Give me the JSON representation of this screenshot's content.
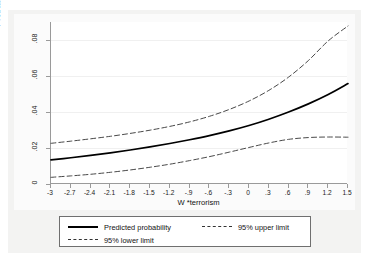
{
  "chart_data": {
    "type": "line",
    "title": "",
    "xlabel": "W  *terrorism",
    "ylabel": "Probability of the rule of law",
    "xlim": [
      -3,
      1.5
    ],
    "ylim": [
      0,
      0.09
    ],
    "grid": true,
    "legend_position": "bottom",
    "xticks": [
      "-3",
      "-2.7",
      "-2.4",
      "-2.1",
      "-1.8",
      "-1.5",
      "-1.2",
      "-.9",
      "-.6",
      "-.3",
      "0",
      ".3",
      ".6",
      ".9",
      "1.2",
      "1.5"
    ],
    "xtick_values": [
      -3,
      -2.7,
      -2.4,
      -2.1,
      -1.8,
      -1.5,
      -1.2,
      -0.9,
      -0.6,
      -0.3,
      0,
      0.3,
      0.6,
      0.9,
      1.2,
      1.5
    ],
    "yticks": [
      "0",
      ".02",
      ".04",
      ".06",
      ".08"
    ],
    "ytick_values": [
      0,
      0.02,
      0.04,
      0.06,
      0.08
    ],
    "x": [
      -3,
      -2.7,
      -2.4,
      -2.1,
      -1.8,
      -1.5,
      -1.2,
      -0.9,
      -0.6,
      -0.3,
      0,
      0.3,
      0.6,
      0.9,
      1.2,
      1.5
    ],
    "series": [
      {
        "name": "Predicted probability",
        "style": "solid",
        "color": "#000000",
        "values": [
          0.0134,
          0.0146,
          0.0159,
          0.0173,
          0.0189,
          0.0206,
          0.0225,
          0.0246,
          0.0269,
          0.0295,
          0.0325,
          0.036,
          0.04,
          0.0445,
          0.0497,
          0.0558
        ]
      },
      {
        "name": "95% upper limit",
        "style": "dashed",
        "color": "#333333",
        "values": [
          0.0226,
          0.0238,
          0.0251,
          0.0265,
          0.0281,
          0.0299,
          0.032,
          0.0345,
          0.0376,
          0.0414,
          0.0461,
          0.052,
          0.0594,
          0.0686,
          0.0795,
          0.0878
        ]
      },
      {
        "name": "95% lower limit",
        "style": "dashed",
        "color": "#333333",
        "values": [
          0.0037,
          0.0045,
          0.0054,
          0.0065,
          0.0078,
          0.0093,
          0.011,
          0.013,
          0.0152,
          0.0177,
          0.0203,
          0.0228,
          0.0248,
          0.0258,
          0.0261,
          0.026
        ]
      }
    ]
  },
  "legend": {
    "entries": [
      {
        "label": "Predicted probability",
        "style": "solid"
      },
      {
        "label": "95% upper limit",
        "style": "dashed"
      },
      {
        "label": "95% lower limit",
        "style": "dashed"
      }
    ]
  },
  "colors": {
    "predicted": "#000000",
    "limits": "#333333",
    "axis": "#9a9a9a",
    "grid": "#f0f0f0",
    "page": "#f3f3f2"
  }
}
